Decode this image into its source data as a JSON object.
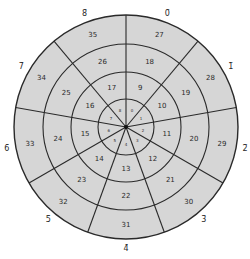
{
  "diagram": {
    "type": "polar-grid",
    "center": [
      126,
      127
    ],
    "ring_radii": [
      28,
      55,
      83,
      112
    ],
    "fill_color": "#d6d6d6",
    "line_color": "#2a2a2a",
    "sector_count": 9,
    "sector_labels": [
      "0̄",
      "1̄",
      "2̄",
      "3̄",
      "4̄",
      "5̄",
      "6̄",
      "7̄",
      "8̄"
    ],
    "sectors": [
      {
        "label": "0̄",
        "center_angle": 20,
        "inner": "0",
        "rings": [
          "9",
          "18",
          "27"
        ]
      },
      {
        "label": "1̄",
        "center_angle": 60,
        "inner": "1",
        "rings": [
          "10",
          "19",
          "28"
        ]
      },
      {
        "label": "2̄",
        "center_angle": 100,
        "inner": "2",
        "rings": [
          "11",
          "20",
          "29"
        ]
      },
      {
        "label": "3̄",
        "center_angle": 140,
        "inner": "3",
        "rings": [
          "12",
          "21",
          "30"
        ]
      },
      {
        "label": "4̄",
        "center_angle": 180,
        "inner": "4",
        "rings": [
          "13",
          "22",
          "31"
        ]
      },
      {
        "label": "5̄",
        "center_angle": 220,
        "inner": "5",
        "rings": [
          "14",
          "23",
          "32"
        ]
      },
      {
        "label": "6̄",
        "center_angle": 260,
        "inner": "6",
        "rings": [
          "15",
          "24",
          "33"
        ]
      },
      {
        "label": "7̄",
        "center_angle": 300,
        "inner": "7",
        "rings": [
          "16",
          "25",
          "34"
        ]
      },
      {
        "label": "8̄",
        "center_angle": 340,
        "inner": "8",
        "rings": [
          "17",
          "26",
          "35"
        ]
      }
    ]
  }
}
